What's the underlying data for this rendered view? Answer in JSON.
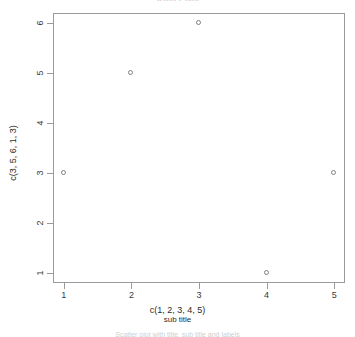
{
  "chart_data": {
    "type": "scatter",
    "title": "scatter plot",
    "caption": "Scatter plot with title, sub title and labels",
    "xlabel": "c(1, 2, 3, 4, 5)",
    "sublabel": "sub title",
    "ylabel": "c(3, 5, 6, 1, 3)",
    "x": [
      1,
      2,
      3,
      4,
      5
    ],
    "values": [
      3,
      5,
      6,
      1,
      3
    ],
    "xticks": [
      "1",
      "2",
      "3",
      "4",
      "5"
    ],
    "yticks": [
      "1",
      "2",
      "3",
      "4",
      "5",
      "6"
    ],
    "xlim": [
      0.84,
      5.16
    ],
    "ylim": [
      0.8,
      6.2
    ],
    "grid": false,
    "legend": false,
    "marker": "open-circle",
    "marker_color": "#808080",
    "axis_color": "#9a9a9a",
    "background": "#ffffff"
  }
}
